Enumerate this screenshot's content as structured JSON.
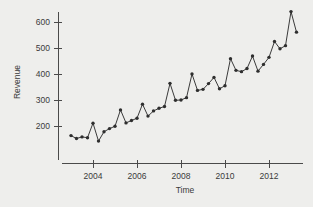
{
  "chart_data": {
    "type": "line",
    "title": "",
    "subtitle": "",
    "xlabel": "Time",
    "ylabel": "Revenue",
    "xlim": [
      2002.9,
      2013.4
    ],
    "ylim": [
      130,
      660
    ],
    "grid": false,
    "legend": null,
    "xticks": [
      2004,
      2006,
      2008,
      2010,
      2012
    ],
    "xtick_labels": [
      "2004",
      "2006",
      "2008",
      "2010",
      "2012"
    ],
    "yticks": [
      200,
      300,
      400,
      500,
      600
    ],
    "ytick_labels": [
      "200",
      "300",
      "400",
      "500",
      "600"
    ],
    "marker": "filled-circle",
    "line_color": "#3b3b3b",
    "marker_color": "#2e2e2e",
    "background_color": "#eeeeec",
    "axis_color": "#4a4a4a",
    "series": [
      {
        "name": "Revenue",
        "x": [
          2003.0,
          2003.25,
          2003.5,
          2003.75,
          2004.0,
          2004.25,
          2004.5,
          2004.75,
          2005.0,
          2005.25,
          2005.5,
          2005.75,
          2006.0,
          2006.25,
          2006.5,
          2006.75,
          2007.0,
          2007.25,
          2007.5,
          2007.75,
          2008.0,
          2008.25,
          2008.5,
          2008.75,
          2009.0,
          2009.25,
          2009.5,
          2009.75,
          2010.0,
          2010.25,
          2010.5,
          2010.75,
          2011.0,
          2011.25,
          2011.5,
          2011.75,
          2012.0,
          2012.25,
          2012.5,
          2012.75,
          2013.0,
          2013.25
        ],
        "values": [
          163,
          152,
          158,
          155,
          211,
          142,
          178,
          190,
          199,
          262,
          212,
          221,
          230,
          284,
          238,
          258,
          268,
          275,
          364,
          299,
          300,
          309,
          400,
          337,
          341,
          363,
          387,
          343,
          355,
          459,
          414,
          409,
          421,
          469,
          411,
          437,
          464,
          525,
          497,
          509,
          640,
          561
        ]
      }
    ]
  },
  "axes": {
    "ylabel": "Revenue",
    "xlabel": "Time"
  }
}
